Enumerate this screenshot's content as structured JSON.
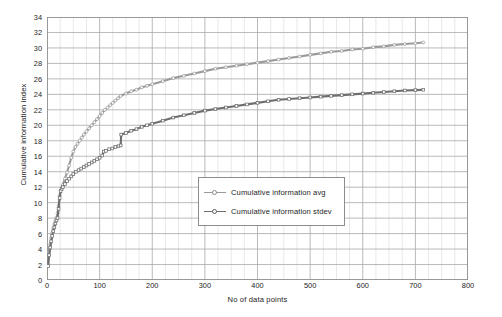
{
  "chart_data": {
    "type": "line",
    "title": "",
    "xlabel": "No of data points",
    "ylabel": "Cumulative information index",
    "xlim": [
      0,
      800
    ],
    "ylim": [
      0,
      34
    ],
    "xticks": [
      0,
      100,
      200,
      300,
      400,
      500,
      600,
      700,
      800
    ],
    "yticks": [
      0,
      2,
      4,
      6,
      8,
      10,
      12,
      14,
      16,
      18,
      20,
      22,
      24,
      26,
      28,
      30,
      32,
      34
    ],
    "x_minor_step": 25,
    "y_minor_step": 2,
    "grid": true,
    "legend_position": "center",
    "series": [
      {
        "name": "Cumulative information avg",
        "color": "#9a9a9a",
        "marker": "open-circle",
        "points": [
          [
            2,
            2.0
          ],
          [
            4,
            3.6
          ],
          [
            6,
            4.6
          ],
          [
            8,
            5.4
          ],
          [
            10,
            6.1
          ],
          [
            12,
            6.7
          ],
          [
            14,
            7.2
          ],
          [
            16,
            7.6
          ],
          [
            18,
            8.0
          ],
          [
            20,
            8.6
          ],
          [
            22,
            9.6
          ],
          [
            24,
            10.9
          ],
          [
            26,
            11.6
          ],
          [
            28,
            11.9
          ],
          [
            30,
            12.3
          ],
          [
            34,
            13.1
          ],
          [
            38,
            13.9
          ],
          [
            42,
            14.8
          ],
          [
            46,
            15.8
          ],
          [
            50,
            16.6
          ],
          [
            54,
            17.2
          ],
          [
            58,
            17.6
          ],
          [
            62,
            18.0
          ],
          [
            66,
            18.4
          ],
          [
            70,
            18.8
          ],
          [
            75,
            19.2
          ],
          [
            80,
            19.6
          ],
          [
            85,
            20.0
          ],
          [
            90,
            20.4
          ],
          [
            95,
            20.8
          ],
          [
            100,
            21.2
          ],
          [
            105,
            21.6
          ],
          [
            110,
            22.0
          ],
          [
            115,
            22.3
          ],
          [
            120,
            22.6
          ],
          [
            125,
            22.9
          ],
          [
            130,
            23.2
          ],
          [
            135,
            23.5
          ],
          [
            140,
            23.8
          ],
          [
            150,
            24.1
          ],
          [
            160,
            24.4
          ],
          [
            170,
            24.6
          ],
          [
            180,
            24.9
          ],
          [
            190,
            25.1
          ],
          [
            200,
            25.3
          ],
          [
            220,
            25.7
          ],
          [
            240,
            26.1
          ],
          [
            260,
            26.4
          ],
          [
            280,
            26.7
          ],
          [
            300,
            27.0
          ],
          [
            320,
            27.3
          ],
          [
            340,
            27.5
          ],
          [
            360,
            27.7
          ],
          [
            380,
            27.9
          ],
          [
            400,
            28.1
          ],
          [
            420,
            28.3
          ],
          [
            440,
            28.5
          ],
          [
            460,
            28.7
          ],
          [
            480,
            28.9
          ],
          [
            500,
            29.1
          ],
          [
            520,
            29.3
          ],
          [
            540,
            29.5
          ],
          [
            560,
            29.6
          ],
          [
            580,
            29.8
          ],
          [
            600,
            29.9
          ],
          [
            620,
            30.1
          ],
          [
            640,
            30.2
          ],
          [
            660,
            30.4
          ],
          [
            680,
            30.5
          ],
          [
            700,
            30.6
          ],
          [
            715,
            30.7
          ]
        ]
      },
      {
        "name": "Cumulative information stdev",
        "color": "#6e6e6e",
        "marker": "open-square",
        "points": [
          [
            2,
            1.8
          ],
          [
            4,
            3.2
          ],
          [
            6,
            4.2
          ],
          [
            8,
            5.0
          ],
          [
            10,
            5.7
          ],
          [
            12,
            6.3
          ],
          [
            14,
            6.8
          ],
          [
            16,
            7.3
          ],
          [
            18,
            7.7
          ],
          [
            20,
            8.0
          ],
          [
            22,
            9.2
          ],
          [
            24,
            10.6
          ],
          [
            26,
            11.5
          ],
          [
            28,
            11.8
          ],
          [
            30,
            12.0
          ],
          [
            34,
            12.4
          ],
          [
            38,
            12.8
          ],
          [
            42,
            13.1
          ],
          [
            46,
            13.4
          ],
          [
            50,
            13.7
          ],
          [
            55,
            14.0
          ],
          [
            60,
            14.2
          ],
          [
            65,
            14.4
          ],
          [
            70,
            14.6
          ],
          [
            75,
            14.8
          ],
          [
            80,
            15.0
          ],
          [
            85,
            15.2
          ],
          [
            90,
            15.4
          ],
          [
            95,
            15.6
          ],
          [
            100,
            15.8
          ],
          [
            105,
            16.1
          ],
          [
            108,
            16.6
          ],
          [
            112,
            16.7
          ],
          [
            118,
            16.9
          ],
          [
            124,
            17.0
          ],
          [
            130,
            17.2
          ],
          [
            136,
            17.3
          ],
          [
            140,
            17.4
          ],
          [
            141,
            18.8
          ],
          [
            150,
            19.0
          ],
          [
            160,
            19.3
          ],
          [
            170,
            19.5
          ],
          [
            180,
            19.8
          ],
          [
            190,
            20.0
          ],
          [
            200,
            20.2
          ],
          [
            220,
            20.6
          ],
          [
            240,
            21.0
          ],
          [
            260,
            21.3
          ],
          [
            280,
            21.6
          ],
          [
            300,
            21.9
          ],
          [
            320,
            22.1
          ],
          [
            340,
            22.3
          ],
          [
            360,
            22.5
          ],
          [
            380,
            22.7
          ],
          [
            400,
            22.9
          ],
          [
            420,
            23.1
          ],
          [
            440,
            23.3
          ],
          [
            460,
            23.4
          ],
          [
            480,
            23.5
          ],
          [
            500,
            23.6
          ],
          [
            520,
            23.7
          ],
          [
            540,
            23.8
          ],
          [
            560,
            23.9
          ],
          [
            580,
            24.0
          ],
          [
            600,
            24.1
          ],
          [
            620,
            24.2
          ],
          [
            640,
            24.3
          ],
          [
            660,
            24.4
          ],
          [
            680,
            24.5
          ],
          [
            700,
            24.55
          ],
          [
            715,
            24.6
          ]
        ]
      }
    ]
  },
  "legend": {
    "items": [
      {
        "label": "Cumulative information avg"
      },
      {
        "label": "Cumulative information stdev"
      }
    ]
  },
  "axes": {
    "x_title": "No of data points",
    "y_title": "Cumulative information index"
  }
}
